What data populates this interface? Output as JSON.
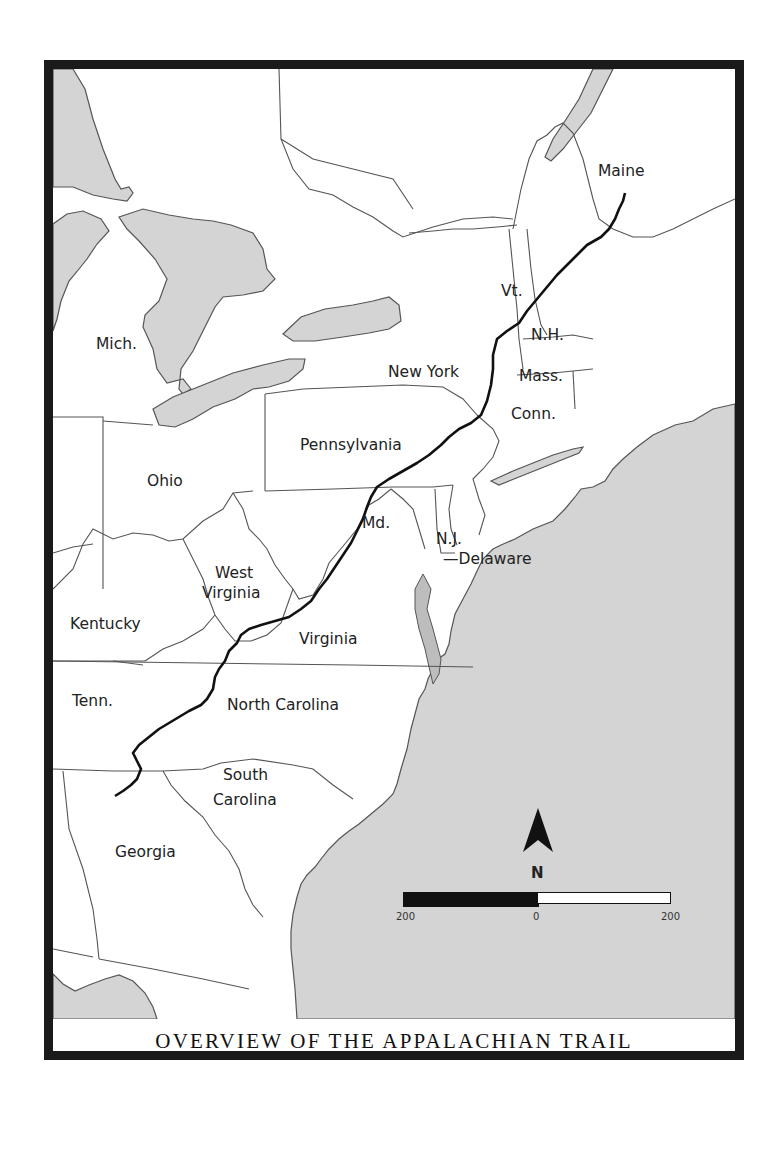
{
  "map": {
    "title": "OVERVIEW OF THE APPALACHIAN TRAIL",
    "colors": {
      "water": "#d4d4d4",
      "land": "#ffffff",
      "border": "#555555",
      "trail": "#111111",
      "frame": "#1a1a1a"
    },
    "state_labels": [
      {
        "id": "maine",
        "text": "Maine"
      },
      {
        "id": "vermont",
        "text": "Vt."
      },
      {
        "id": "new-hampshire",
        "text": "N.H."
      },
      {
        "id": "new-york",
        "text": "New York"
      },
      {
        "id": "massachusetts",
        "text": "Mass."
      },
      {
        "id": "connecticut",
        "text": "Conn."
      },
      {
        "id": "michigan",
        "text": "Mich."
      },
      {
        "id": "pennsylvania",
        "text": "Pennsylvania"
      },
      {
        "id": "ohio",
        "text": "Ohio"
      },
      {
        "id": "maryland",
        "text": "Md."
      },
      {
        "id": "new-jersey",
        "text": "N.J."
      },
      {
        "id": "delaware",
        "text": "Delaware"
      },
      {
        "id": "west-virginia-1",
        "text": "West"
      },
      {
        "id": "west-virginia-2",
        "text": "Virginia"
      },
      {
        "id": "kentucky",
        "text": "Kentucky"
      },
      {
        "id": "virginia",
        "text": "Virginia"
      },
      {
        "id": "tennessee",
        "text": "Tenn."
      },
      {
        "id": "north-carolina",
        "text": "North Carolina"
      },
      {
        "id": "south-carolina-1",
        "text": "South"
      },
      {
        "id": "south-carolina-2",
        "text": "Carolina"
      },
      {
        "id": "georgia",
        "text": "Georgia"
      }
    ],
    "compass": {
      "letter": "N"
    },
    "scale_bar": {
      "left": "200",
      "middle": "0",
      "right": "200"
    }
  }
}
